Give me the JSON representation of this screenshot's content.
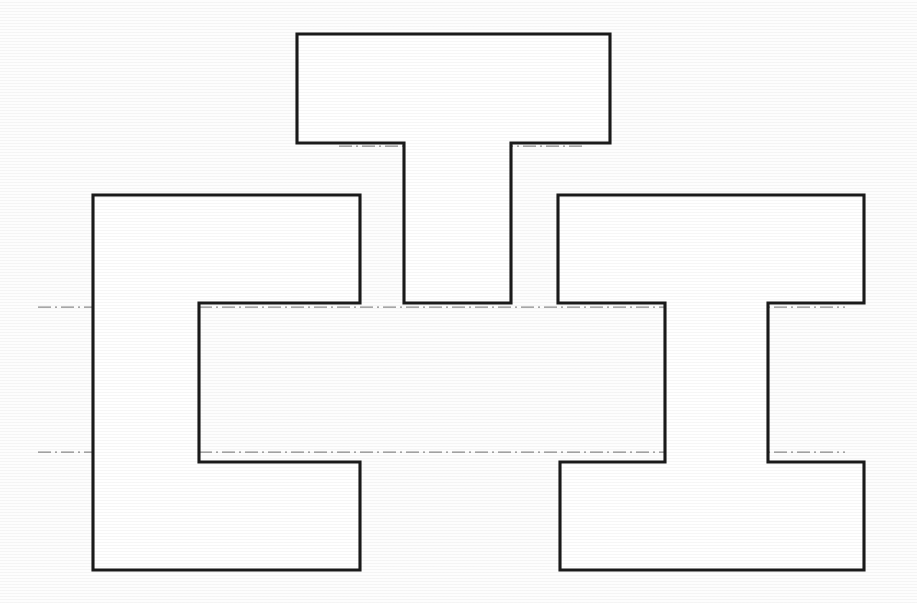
{
  "document": {
    "kind": "engineering-line-drawing",
    "title": "Three Profile Outlines",
    "background_color": "#fdfdfd",
    "line_color": "#1a1a1a",
    "centerline_color": "#8a8a8a",
    "canvas_width": 917,
    "canvas_height": 603
  },
  "figures": [
    {
      "id": "tee-profile",
      "name": "T-shaped profile",
      "description": "Inverted T / tee cross-section with wide top flange and downward central stem",
      "points": "297,34 610,34 610,143 511,143 511,303 404,303 404,143 297,143",
      "bounds": {
        "x": 297,
        "y": 34,
        "width": 313,
        "height": 269
      },
      "flange": {
        "left": 297,
        "right": 610,
        "top": 34,
        "bottom": 143
      },
      "stem": {
        "left": 404,
        "right": 511,
        "top": 143,
        "bottom": 303
      }
    },
    {
      "id": "cee-profile",
      "name": "C-shaped profile",
      "description": "C channel cross-section, open toward the right with a rectangular notch",
      "points": "93,195 360,195 360,303 199,303 199,462 360,462 360,570 93,570",
      "bounds": {
        "x": 93,
        "y": 195,
        "width": 267,
        "height": 375
      },
      "notch": {
        "left": 199,
        "right": 360,
        "top": 303,
        "bottom": 462
      }
    },
    {
      "id": "eye-profile",
      "name": "I-shaped profile",
      "description": "I beam cross-section with top flange, narrow web and bottom flange",
      "points": "558,195 864,195 864,303 768,303 768,462 864,462 864,570 560,570 560,462 665,462 665,303 558,303",
      "bounds": {
        "x": 558,
        "y": 195,
        "width": 306,
        "height": 375
      },
      "top_flange": {
        "left": 558,
        "right": 864,
        "top": 195,
        "bottom": 303
      },
      "web": {
        "left": 665,
        "right": 768,
        "top": 303,
        "bottom": 462
      },
      "bottom_flange": {
        "left": 560,
        "right": 864,
        "top": 462,
        "bottom": 570
      }
    }
  ],
  "centerlines": [
    {
      "id": "centerline-tee",
      "name": "horizontal centerline through tee shoulder",
      "x1": 339,
      "y1": 146,
      "x2": 583,
      "y2": 146
    },
    {
      "id": "centerline-upper",
      "name": "upper horizontal centerline across C and I profiles",
      "x1": 38,
      "y1": 307,
      "x2": 845,
      "y2": 307
    },
    {
      "id": "centerline-lower",
      "name": "lower horizontal centerline across C and I profiles",
      "x1": 38,
      "y1": 452,
      "x2": 845,
      "y2": 452
    }
  ]
}
